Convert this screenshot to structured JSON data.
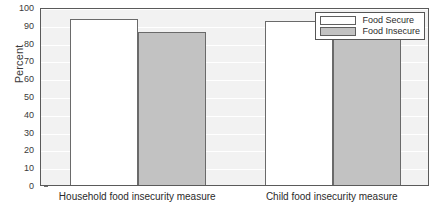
{
  "chart_data": {
    "type": "bar",
    "title": "",
    "xlabel": "",
    "ylabel": "Percent",
    "ylim": [
      0,
      100
    ],
    "yticks": [
      0,
      10,
      20,
      30,
      40,
      50,
      60,
      70,
      80,
      90,
      100
    ],
    "grid": true,
    "legend_position": "top-right",
    "categories": [
      "Household food insecurity measure",
      "Child food insecurity measure"
    ],
    "series": [
      {
        "name": "Food Secure",
        "color": "#ffffff",
        "values": [
          93,
          92
        ]
      },
      {
        "name": "Food Insecure",
        "color": "#c2c2c2",
        "values": [
          86,
          85
        ]
      }
    ]
  },
  "axes": {
    "y_title": "Percent",
    "y_tick_labels": [
      "100",
      "90",
      "80",
      "70",
      "60",
      "50",
      "40",
      "30",
      "20",
      "10",
      "0"
    ],
    "x_tick_labels": [
      "Household food insecurity measure",
      "Child food insecurity measure"
    ]
  },
  "legend": {
    "entries": [
      {
        "label": "Food Secure"
      },
      {
        "label": "Food Insecure"
      }
    ]
  },
  "colors": {
    "food_secure": "#ffffff",
    "food_insecure": "#c2c2c2",
    "plot_background": "#f2f2f2",
    "frame": "#5a5a5a",
    "gridline": "#ffffff"
  }
}
